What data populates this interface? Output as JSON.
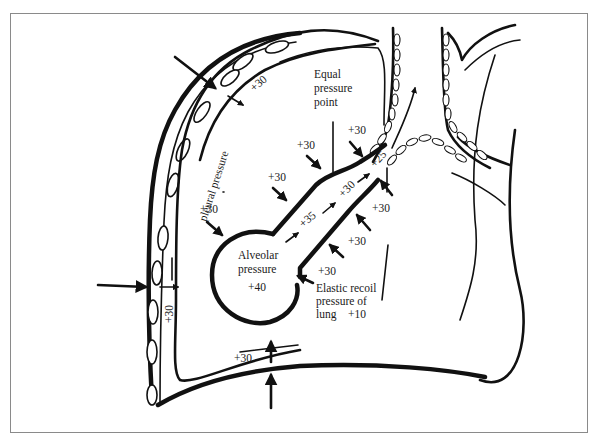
{
  "diagram": {
    "labels": {
      "equal_pressure_point_line1": "Equal",
      "equal_pressure_point_line2": "pressure",
      "equal_pressure_point_line3": "point",
      "pleural_pressure": "pleural pressure",
      "alveolar_pressure_line1": "Alveolar",
      "alveolar_pressure_line2": "pressure",
      "alveolar_value": "+40",
      "elastic_recoil_line1": "Elastic recoil",
      "elastic_recoil_line2": "pressure of",
      "elastic_recoil_line3": "lung",
      "elastic_recoil_value": "+10",
      "airway_35": "+35",
      "airway_30": "+30",
      "airway_25": "+25",
      "pleural_top": "+30",
      "pleural_side": "+30",
      "pleural_bottom": "+30",
      "around_1": "+30",
      "around_2": "+30",
      "around_3": "+30",
      "around_4": "+30",
      "around_5": "+30",
      "around_6": "+30",
      "around_7": "+30"
    },
    "colors": {
      "ink": "#111111",
      "background": "#ffffff",
      "frame_border": "#8a8a8a"
    }
  }
}
